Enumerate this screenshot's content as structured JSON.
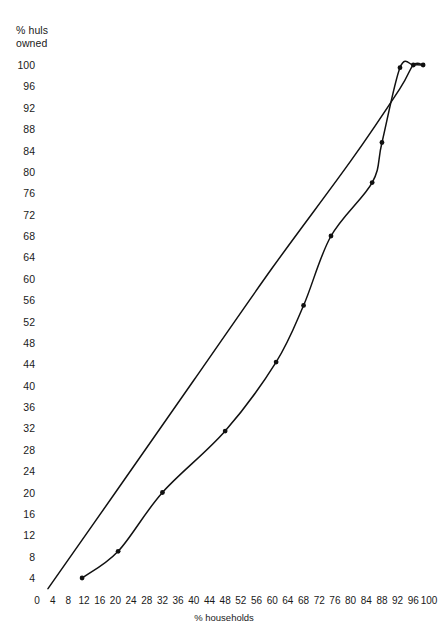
{
  "chart_data": {
    "type": "line",
    "title": "",
    "ylabel": "% huls\nowned",
    "xlabel": "% households",
    "xlim": [
      0,
      100
    ],
    "ylim": [
      0,
      100
    ],
    "grid": false,
    "legend": "none",
    "xticks": [
      0,
      4,
      8,
      12,
      16,
      20,
      24,
      28,
      32,
      36,
      40,
      44,
      48,
      52,
      56,
      60,
      64,
      68,
      72,
      76,
      80,
      84,
      88,
      92,
      96,
      100
    ],
    "yticks": [
      4,
      8,
      12,
      16,
      20,
      24,
      28,
      32,
      36,
      40,
      44,
      48,
      52,
      56,
      60,
      64,
      68,
      72,
      76,
      80,
      84,
      88,
      92,
      96,
      100
    ],
    "series": [
      {
        "name": "equality-line",
        "markers": false,
        "points": [
          {
            "x": 2.8,
            "y": 2.0
          },
          {
            "x": 20.0,
            "y": 20.0
          },
          {
            "x": 40.0,
            "y": 41.0
          },
          {
            "x": 60.0,
            "y": 62.0
          },
          {
            "x": 80.0,
            "y": 82.0
          },
          {
            "x": 92.5,
            "y": 95.5
          },
          {
            "x": 96.0,
            "y": 100.0
          },
          {
            "x": 98.5,
            "y": 100.0
          }
        ]
      },
      {
        "name": "lorenz-curve",
        "markers": true,
        "points": [
          {
            "x": 11.5,
            "y": 4.0
          },
          {
            "x": 20.7,
            "y": 9.0
          },
          {
            "x": 32.0,
            "y": 20.0
          },
          {
            "x": 48.0,
            "y": 31.5
          },
          {
            "x": 61.0,
            "y": 44.4
          },
          {
            "x": 68.0,
            "y": 55.0
          },
          {
            "x": 75.0,
            "y": 68.0
          },
          {
            "x": 85.5,
            "y": 78.0
          },
          {
            "x": 88.0,
            "y": 85.5
          },
          {
            "x": 92.6,
            "y": 99.5
          },
          {
            "x": 96.0,
            "y": 100.0
          },
          {
            "x": 98.5,
            "y": 100.0
          }
        ]
      }
    ]
  }
}
